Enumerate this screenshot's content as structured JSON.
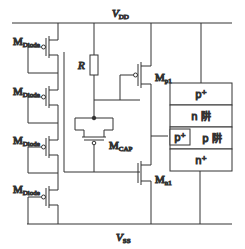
{
  "diagram": {
    "supply_top": {
      "symbol": "V",
      "subscript": "DD"
    },
    "supply_bottom": {
      "symbol": "V",
      "subscript": "SS"
    },
    "resistor": {
      "label": "R"
    },
    "diode_chain": [
      {
        "symbol": "M",
        "subscript": "Diode"
      },
      {
        "symbol": "M",
        "subscript": "Diode"
      },
      {
        "symbol": "M",
        "subscript": "Diode"
      },
      {
        "symbol": "M",
        "subscript": "Diode"
      }
    ],
    "mcap": {
      "symbol": "M",
      "subscript": "CAP"
    },
    "mp1": {
      "symbol": "M",
      "subscript": "p1"
    },
    "mn1": {
      "symbol": "M",
      "subscript": "n1"
    },
    "scr_stack": {
      "layers": [
        {
          "label": "p⁺"
        },
        {
          "label": "n 阱"
        },
        {
          "label": "p 阱"
        },
        {
          "label": "n⁺"
        }
      ],
      "inner_contact": {
        "label": "p⁺"
      }
    }
  }
}
